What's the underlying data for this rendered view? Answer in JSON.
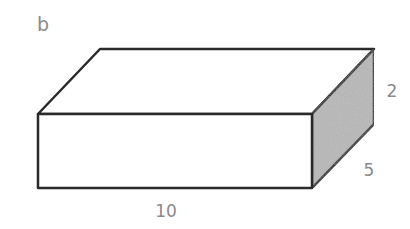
{
  "figure": {
    "panel_label": "b",
    "shape": "rectangular-prism",
    "dimensions": {
      "length": "10",
      "width": "5",
      "height": "2"
    },
    "colors": {
      "edge": "#2a2a2a",
      "shaded_face": "#b8b8b8",
      "label": "#8a8a8a"
    }
  }
}
